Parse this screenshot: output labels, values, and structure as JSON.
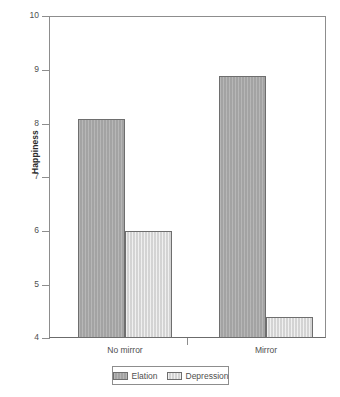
{
  "chart_data": {
    "type": "bar",
    "title": "",
    "subtitle": "",
    "xlabel": "",
    "ylabel": "Happiness",
    "categories": [
      "No mirror",
      "Mirror"
    ],
    "series": [
      {
        "name": "Elation",
        "values": [
          8.1,
          8.9
        ],
        "color": "#a9a9a9"
      },
      {
        "name": "Depression",
        "values": [
          6.0,
          4.4
        ],
        "color": "#dddddd"
      }
    ],
    "ylim": [
      4,
      10
    ],
    "ytick_labels": [
      "10",
      "9",
      "8",
      "7",
      "6",
      "5",
      "4"
    ],
    "ytick_values": [
      10,
      9,
      8,
      7,
      6,
      5,
      4
    ],
    "grid": false,
    "legend_position": "bottom-center",
    "legend_entries": [
      "Elation",
      "Depression"
    ],
    "bar_grouping": "clustered",
    "annotations": []
  },
  "axes": {
    "y_title": "Happiness",
    "y_tick_10": "10",
    "y_tick_9": "9",
    "y_tick_8": "8",
    "y_tick_7": "7",
    "y_tick_6": "6",
    "y_tick_5": "5",
    "y_tick_4": "4"
  },
  "x_categories": {
    "group_1": "No mirror",
    "group_2": "Mirror"
  },
  "legend": {
    "entry_1_label": "Elation",
    "entry_2_label": "Depression",
    "entry_1_color": "#a9a9a9",
    "entry_2_color": "#dddddd"
  }
}
